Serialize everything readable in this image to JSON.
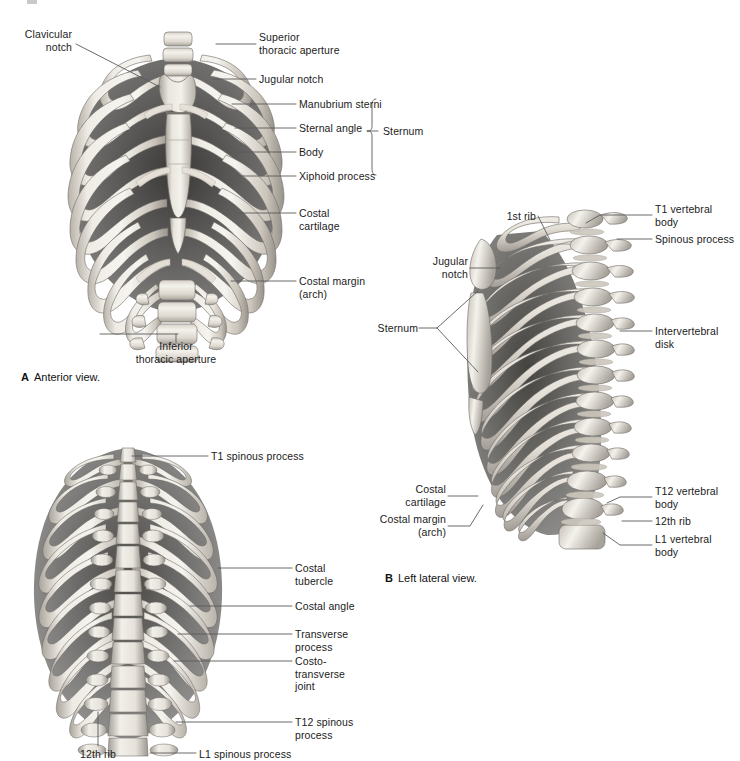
{
  "document": {
    "background_color": "#ffffff",
    "figure_type": "anatomical-illustration",
    "subject": "Thoracic cage / rib cage skeleton"
  },
  "panels": [
    {
      "id": "A",
      "letter": "A",
      "caption": "Anterior view.",
      "labels": [
        {
          "id": "clavicular-notch",
          "text": "Clavicular\nnotch",
          "align": "right"
        },
        {
          "id": "superior-thoracic-aperture",
          "text": "Superior\nthoracic aperture",
          "align": "left"
        },
        {
          "id": "jugular-notch",
          "text": "Jugular notch",
          "align": "left"
        },
        {
          "id": "manubrium-sterni",
          "text": "Manubrium sterni",
          "align": "left"
        },
        {
          "id": "sternal-angle",
          "text": "Sternal angle",
          "align": "left"
        },
        {
          "id": "body",
          "text": "Body",
          "align": "left"
        },
        {
          "id": "xiphoid-process",
          "text": "Xiphoid process",
          "align": "left"
        },
        {
          "id": "sternum-bracket",
          "text": "Sternum",
          "align": "left"
        },
        {
          "id": "costal-cartilage",
          "text": "Costal\ncartilage",
          "align": "left"
        },
        {
          "id": "costal-margin-arch",
          "text": "Costal margin\n(arch)",
          "align": "left"
        },
        {
          "id": "inferior-thoracic-aperture",
          "text": "Inferior\nthoracic aperture",
          "align": "center"
        }
      ]
    },
    {
      "id": "B",
      "letter": "B",
      "caption": "Left lateral view.",
      "labels": [
        {
          "id": "first-rib",
          "text": "1st rib",
          "align": "right"
        },
        {
          "id": "t1-vertebral-body",
          "text": "T1 vertebral\nbody",
          "align": "left"
        },
        {
          "id": "spinous-process",
          "text": "Spinous process",
          "align": "left"
        },
        {
          "id": "jugular-notch",
          "text": "Jugular\nnotch",
          "align": "right"
        },
        {
          "id": "sternum",
          "text": "Sternum",
          "align": "right"
        },
        {
          "id": "intervertebral-disk",
          "text": "Intervertebral\ndisk",
          "align": "left"
        },
        {
          "id": "costal-cartilage",
          "text": "Costal\ncartilage",
          "align": "right"
        },
        {
          "id": "costal-margin-arch",
          "text": "Costal margin\n(arch)",
          "align": "right"
        },
        {
          "id": "t12-vertebral-body",
          "text": "T12 vertebral\nbody",
          "align": "left"
        },
        {
          "id": "twelfth-rib",
          "text": "12th rib",
          "align": "left"
        },
        {
          "id": "l1-vertebral-body",
          "text": "L1 vertebral\nbody",
          "align": "left"
        }
      ]
    },
    {
      "id": "C",
      "letter": "",
      "caption": "",
      "labels": [
        {
          "id": "t1-spinous-process",
          "text": "T1 spinous process",
          "align": "left"
        },
        {
          "id": "costal-tubercle",
          "text": "Costal\ntubercle",
          "align": "left"
        },
        {
          "id": "costal-angle",
          "text": "Costal angle",
          "align": "left"
        },
        {
          "id": "transverse-process",
          "text": "Transverse\nprocess",
          "align": "left"
        },
        {
          "id": "costotransverse-joint",
          "text": "Costo-\ntransverse\njoint",
          "align": "left"
        },
        {
          "id": "t12-spinous-process",
          "text": "T12 spinous\nprocess",
          "align": "left"
        },
        {
          "id": "twelfth-rib",
          "text": "12th rib",
          "align": "center"
        },
        {
          "id": "l1-spinous-process",
          "text": "L1 spinous process",
          "align": "left"
        }
      ]
    }
  ],
  "colors": {
    "bone_light": "#f0ede7",
    "bone_mid": "#cfc9c0",
    "bone_shadow": "#8f8b85",
    "bone_dark": "#4b4845",
    "cavity": "#3d3b39",
    "leader_line": "#5a5a5a",
    "text": "#1b1b1b"
  }
}
